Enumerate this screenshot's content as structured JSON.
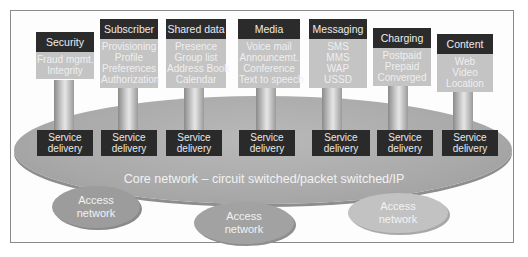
{
  "diagram": {
    "core_label": "Core network – circuit switched/packet switched/IP",
    "service_delivery_label": [
      "Service",
      "delivery"
    ],
    "access_networks": [
      {
        "label": [
          "Access",
          "network"
        ]
      },
      {
        "label": [
          "Access",
          "network"
        ]
      },
      {
        "label": [
          "Access",
          "network"
        ]
      }
    ],
    "services": [
      {
        "title": "Security",
        "items": [
          "Fraud mgmt.",
          "Integrity"
        ]
      },
      {
        "title": "Subscriber",
        "items": [
          "Provisioning",
          "Profile",
          "Preferences",
          "Authorization"
        ]
      },
      {
        "title": "Shared data",
        "items": [
          "Presence",
          "Group list",
          "Address Book",
          "Calendar"
        ]
      },
      {
        "title": "Media",
        "items": [
          "Voice mail",
          "Announcemt.",
          "Conference",
          "Text to speech"
        ]
      },
      {
        "title": "Messaging",
        "items": [
          "SMS",
          "MMS",
          "WAP",
          "USSD"
        ]
      },
      {
        "title": "Charging",
        "items": [
          "Postpaid",
          "Prepaid",
          "Converged"
        ]
      },
      {
        "title": "Content",
        "items": [
          "Web",
          "Video",
          "Location"
        ]
      }
    ],
    "colors": {
      "card_title_bg": "#2b2b2b",
      "card_body_bg": "#c4c4c4",
      "core_bg": "#ababab",
      "service_delivery_bg": "#2a2a2a"
    }
  }
}
